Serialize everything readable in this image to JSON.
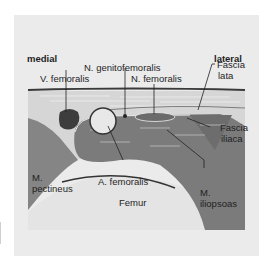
{
  "labels": {
    "medial": "medial",
    "lateral": "lateral",
    "n_genitofemoralis": "N. genitofemoralis",
    "v_femoralis": "V. femoralis",
    "n_femoralis": "N. femoralis",
    "fascia_lata_1": "Fascia",
    "fascia_lata_2": "lata",
    "fascia_iliaca_1": "Fascia",
    "fascia_iliaca_2": "iliaca",
    "m_pectineus_1": "M.",
    "m_pectineus_2": "pectineus",
    "a_femoralis": "A. femoralis",
    "m_iliopsoas_1": "M.",
    "m_iliopsoas_2": "iliopsoas",
    "femur": "Femur"
  },
  "colors": {
    "panel_bg": "#ebebeb",
    "subcutaneous": "#d9d9d9",
    "fascia_line": "#4a4a4a",
    "muscle_dark": "#7a7a7a",
    "pectineus": "#8a8a8a",
    "vein": "#3d3d3d",
    "artery": "#e6e6e6",
    "bone": "#e4e4e4",
    "text": "#1f1f1f"
  }
}
